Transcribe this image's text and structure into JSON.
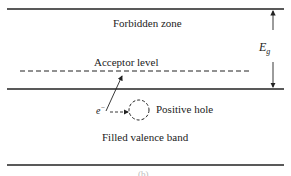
{
  "diagram": {
    "forbidden_zone_label": "Forbidden zone",
    "acceptor_level_label": "Acceptor level",
    "energy_gap_label": "E",
    "energy_gap_subscript": "g",
    "electron_label": "e",
    "electron_superscript": "−",
    "positive_hole_label": "Positive hole",
    "valence_band_label": "Filled valence band",
    "caption": "(b)"
  }
}
